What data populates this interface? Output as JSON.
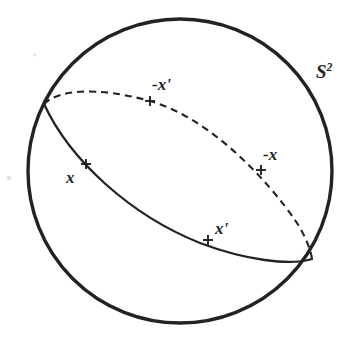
{
  "figure": {
    "background_color": "#ffffff",
    "stroke_color": "#232323",
    "canvas": {
      "width": 357,
      "height": 348
    },
    "sphere": {
      "name": "S2",
      "label": "S",
      "label_superscript": "2",
      "center_x": 180,
      "center_y": 171,
      "radius": 153,
      "stroke_width": 3.4
    },
    "great_circle": {
      "front_arc_style": "solid",
      "back_arc_style": "dashed",
      "dash_pattern": "7 5",
      "stroke_width": 2.2,
      "left_junction": {
        "x": 44,
        "y": 104
      },
      "right_junction": {
        "x": 312,
        "y": 259
      }
    },
    "points": [
      {
        "id": "x",
        "label": "x",
        "marker": "+",
        "marker_x": 86,
        "marker_y": 164,
        "arc": "front",
        "label_x": 66,
        "label_y": 169
      },
      {
        "id": "x-prime",
        "label": "x'",
        "marker": "+",
        "marker_x": 208,
        "marker_y": 240,
        "arc": "front",
        "label_x": 215,
        "label_y": 220
      },
      {
        "id": "neg-x",
        "label": "-x",
        "marker": "+",
        "marker_x": 261,
        "marker_y": 170,
        "arc": "back",
        "label_x": 263,
        "label_y": 146
      },
      {
        "id": "neg-x-prime",
        "label": "-x'",
        "marker": "+",
        "marker_x": 150,
        "marker_y": 101,
        "arc": "back",
        "label_x": 152,
        "label_y": 76
      }
    ],
    "marker_size": 9,
    "marker_stroke_width": 1.9
  }
}
